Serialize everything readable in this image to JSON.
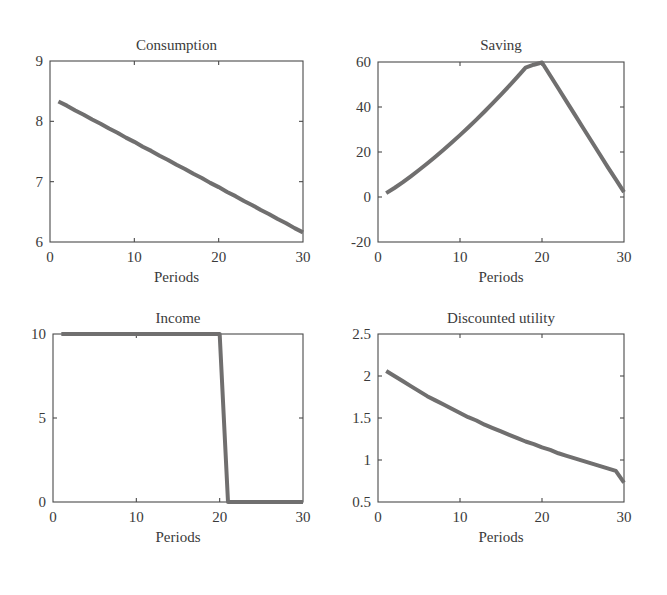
{
  "figure": {
    "width": 667,
    "height": 595,
    "background": "#ffffff",
    "line_color": "#706f6f",
    "axis_color": "#4a4a4a",
    "text_color": "#3a3a3a",
    "line_width": 4.0
  },
  "chart_data": [
    {
      "type": "line",
      "panel": "top-left",
      "title": "Consumption",
      "xlabel": "Periods",
      "ylabel": "",
      "xlim": [
        0,
        30
      ],
      "ylim": [
        6,
        9
      ],
      "xticks": [
        0,
        10,
        20,
        30
      ],
      "xticklabels": [
        "0",
        "10",
        "20",
        "30"
      ],
      "yticks": [
        6,
        7,
        8,
        9
      ],
      "yticklabels": [
        "6",
        "7",
        "8",
        "9"
      ],
      "grid": false,
      "legend": null,
      "x": [
        1,
        2,
        3,
        4,
        5,
        6,
        7,
        8,
        9,
        10,
        11,
        12,
        13,
        14,
        15,
        16,
        17,
        18,
        19,
        20,
        21,
        22,
        23,
        24,
        25,
        26,
        27,
        28,
        29,
        30
      ],
      "values": [
        8.33,
        8.26,
        8.18,
        8.11,
        8.03,
        7.96,
        7.88,
        7.81,
        7.73,
        7.66,
        7.58,
        7.51,
        7.43,
        7.36,
        7.28,
        7.21,
        7.13,
        7.06,
        6.98,
        6.91,
        6.83,
        6.76,
        6.68,
        6.61,
        6.53,
        6.46,
        6.38,
        6.31,
        6.23,
        6.16
      ]
    },
    {
      "type": "line",
      "panel": "top-right",
      "title": "Saving",
      "xlabel": "Periods",
      "ylabel": "",
      "xlim": [
        0,
        30
      ],
      "ylim": [
        -20,
        60
      ],
      "xticks": [
        0,
        10,
        20,
        30
      ],
      "xticklabels": [
        "0",
        "10",
        "20",
        "30"
      ],
      "yticks": [
        -20,
        0,
        20,
        40,
        60
      ],
      "yticklabels": [
        "-20",
        "0",
        "20",
        "40",
        "60"
      ],
      "grid": false,
      "legend": null,
      "x": [
        1,
        2,
        3,
        4,
        5,
        6,
        7,
        8,
        9,
        10,
        11,
        12,
        13,
        14,
        15,
        16,
        17,
        18,
        19,
        20,
        21,
        22,
        23,
        24,
        25,
        26,
        27,
        28,
        29,
        30
      ],
      "values": [
        1.7,
        4.0,
        6.5,
        9.2,
        12.0,
        14.9,
        17.9,
        21.0,
        24.2,
        27.5,
        30.9,
        34.4,
        38.0,
        41.7,
        45.5,
        49.4,
        53.4,
        57.5,
        58.8,
        59.8,
        54.0,
        48.2,
        42.4,
        36.6,
        30.8,
        25.0,
        19.2,
        13.4,
        7.8,
        2.2
      ]
    },
    {
      "type": "line",
      "panel": "bottom-left",
      "title": "Income",
      "xlabel": "Periods",
      "ylabel": "",
      "xlim": [
        0,
        30
      ],
      "ylim": [
        0,
        10
      ],
      "xticks": [
        0,
        10,
        20,
        30
      ],
      "xticklabels": [
        "0",
        "10",
        "20",
        "30"
      ],
      "yticks": [
        0,
        5,
        10
      ],
      "yticklabels": [
        "0",
        "5",
        "10"
      ],
      "grid": false,
      "legend": null,
      "x": [
        1,
        2,
        3,
        4,
        5,
        6,
        7,
        8,
        9,
        10,
        11,
        12,
        13,
        14,
        15,
        16,
        17,
        18,
        19,
        20,
        21,
        22,
        23,
        24,
        25,
        26,
        27,
        28,
        29,
        30
      ],
      "values": [
        10,
        10,
        10,
        10,
        10,
        10,
        10,
        10,
        10,
        10,
        10,
        10,
        10,
        10,
        10,
        10,
        10,
        10,
        10,
        10,
        0,
        0,
        0,
        0,
        0,
        0,
        0,
        0,
        0,
        0
      ]
    },
    {
      "type": "line",
      "panel": "bottom-right",
      "title": "Discounted utility",
      "xlabel": "Periods",
      "ylabel": "",
      "xlim": [
        0,
        30
      ],
      "ylim": [
        0.5,
        2.5
      ],
      "xticks": [
        0,
        10,
        20,
        30
      ],
      "xticklabels": [
        "0",
        "10",
        "20",
        "30"
      ],
      "yticks": [
        0.5,
        1,
        1.5,
        2,
        2.5
      ],
      "yticklabels": [
        "0.5",
        "1",
        "1.5",
        "2",
        "2.5"
      ],
      "grid": false,
      "legend": null,
      "x": [
        1,
        2,
        3,
        4,
        5,
        6,
        7,
        8,
        9,
        10,
        11,
        12,
        13,
        14,
        15,
        16,
        17,
        18,
        19,
        20,
        21,
        22,
        23,
        24,
        25,
        26,
        27,
        28,
        29,
        30
      ],
      "values": [
        2.06,
        2.0,
        1.94,
        1.88,
        1.82,
        1.76,
        1.71,
        1.66,
        1.61,
        1.56,
        1.51,
        1.47,
        1.42,
        1.38,
        1.34,
        1.3,
        1.26,
        1.22,
        1.19,
        1.15,
        1.12,
        1.08,
        1.05,
        1.02,
        0.99,
        0.96,
        0.93,
        0.9,
        0.87,
        0.73
      ]
    }
  ]
}
